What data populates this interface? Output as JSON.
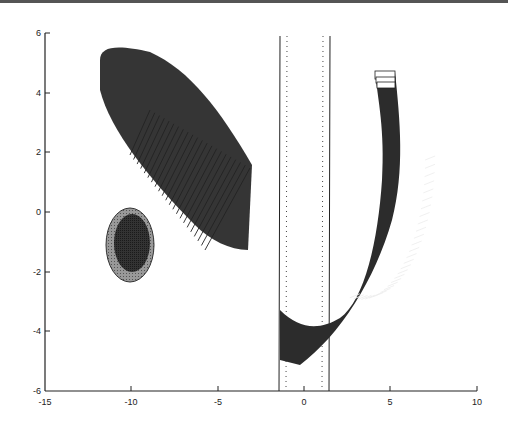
{
  "chart_data": {
    "type": "scatter",
    "title": "",
    "xlabel": "",
    "ylabel": "",
    "xlim": [
      -15,
      10
    ],
    "ylim": [
      -6,
      6
    ],
    "grid": false,
    "legend": null,
    "x_ticks": [
      "-15",
      "-10",
      "-5",
      "0",
      "5",
      "10"
    ],
    "y_ticks": [
      "6",
      "4",
      "2",
      "0",
      "-2",
      "-4",
      "-6"
    ],
    "elements": [
      {
        "name": "obstacle-ellipse",
        "kind": "filled ellipse with ring",
        "center": [
          -10,
          -1
        ],
        "outer_radii": [
          1.4,
          1.25
        ],
        "inner_radii": [
          1.0,
          1.0
        ]
      },
      {
        "name": "swept-box-trajectory-left",
        "kind": "sequence of rotated rectangles",
        "from": [
          -3.3,
          0
        ],
        "to": [
          -10.5,
          4.8
        ],
        "note": "dense dark fan narrowing to upper-left"
      },
      {
        "name": "corridor-walls",
        "kind": "vertical lines",
        "x": [
          -1.5,
          1.5
        ],
        "y_range": [
          -6,
          6
        ]
      },
      {
        "name": "corridor-centerlines",
        "kind": "dotted vertical lines",
        "x": [
          -1.1,
          1.1
        ],
        "y_range": [
          -6,
          6
        ]
      },
      {
        "name": "swept-box-trajectory-u",
        "kind": "U-shaped sequence of rectangles",
        "path": [
          [
            5,
            4.7
          ],
          [
            5.8,
            1
          ],
          [
            4.5,
            -2.5
          ],
          [
            1.5,
            -4.5
          ],
          [
            -1.5,
            -4.2
          ]
        ]
      }
    ]
  }
}
